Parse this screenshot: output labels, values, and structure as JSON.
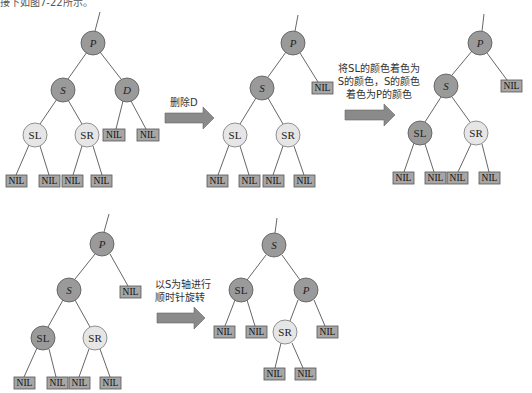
{
  "header_fragment": "接下如图7-22所示。",
  "colors": {
    "black_node": "#9a9a9a",
    "red_node": "#e6e6e6",
    "nil_box": "#a6a6a6",
    "edge": "#555555",
    "arrow": "#8a8a8a"
  },
  "steps": [
    {
      "id": "step1",
      "caption": "删除D"
    },
    {
      "id": "step2",
      "caption_lines": [
        "将SL的颜色着色为",
        "S的颜色，S的颜色",
        "着色为P的颜色"
      ]
    },
    {
      "id": "step3",
      "caption_lines": [
        "以S为轴进行",
        "顺时针旋转"
      ]
    }
  ],
  "nil_label": "NIL",
  "trees": [
    {
      "id": "tree1",
      "nodes": [
        {
          "label": "P",
          "color": "black",
          "italic": true
        },
        {
          "label": "S",
          "color": "black",
          "italic": true
        },
        {
          "label": "D",
          "color": "black",
          "italic": true
        },
        {
          "label": "SL",
          "color": "red",
          "italic": false
        },
        {
          "label": "SR",
          "color": "red",
          "italic": false
        }
      ]
    },
    {
      "id": "tree2",
      "nodes": [
        {
          "label": "P",
          "color": "black",
          "italic": true
        },
        {
          "label": "S",
          "color": "black",
          "italic": true
        },
        {
          "label": "SL",
          "color": "red",
          "italic": false
        },
        {
          "label": "SR",
          "color": "red",
          "italic": false
        }
      ]
    },
    {
      "id": "tree3",
      "nodes": [
        {
          "label": "P",
          "color": "black",
          "italic": true
        },
        {
          "label": "S",
          "color": "black",
          "italic": true
        },
        {
          "label": "SL",
          "color": "black",
          "italic": false
        },
        {
          "label": "SR",
          "color": "red",
          "italic": false
        }
      ]
    },
    {
      "id": "tree4",
      "nodes": [
        {
          "label": "P",
          "color": "black",
          "italic": true
        },
        {
          "label": "S",
          "color": "black",
          "italic": true
        },
        {
          "label": "SL",
          "color": "black",
          "italic": false
        },
        {
          "label": "SR",
          "color": "red",
          "italic": false
        }
      ]
    },
    {
      "id": "tree5",
      "nodes": [
        {
          "label": "S",
          "color": "black",
          "italic": true
        },
        {
          "label": "SL",
          "color": "black",
          "italic": false
        },
        {
          "label": "P",
          "color": "black",
          "italic": true
        },
        {
          "label": "SR",
          "color": "red",
          "italic": false
        }
      ]
    }
  ]
}
